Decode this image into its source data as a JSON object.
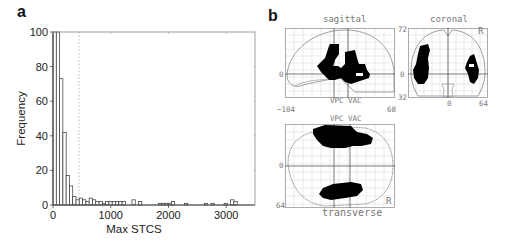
{
  "panels": {
    "a": {
      "label": "a"
    },
    "b": {
      "label": "b"
    }
  },
  "chart_data": [
    {
      "panel": "a",
      "type": "bar",
      "title": "",
      "xlabel": "Max STCS",
      "ylabel": "Frequency",
      "xlim": [
        0,
        3500
      ],
      "ylim": [
        0,
        100
      ],
      "xticks": [
        0,
        1000,
        2000,
        3000
      ],
      "yticks": [
        0,
        20,
        40,
        60,
        80,
        100
      ],
      "threshold_line_x": 450,
      "threshold_line_style": "dotted",
      "grid": false,
      "bin_width": 57,
      "bins_start": [
        0,
        57,
        114,
        171,
        228,
        285,
        342,
        399,
        456,
        513,
        570,
        627,
        684,
        741,
        798,
        855,
        912,
        969,
        1026,
        1083,
        1140,
        1197,
        1368,
        1482,
        1824,
        1881,
        1938,
        1995,
        2052,
        2280,
        2622,
        2736,
        2964,
        3078,
        3135
      ],
      "values": [
        100,
        100,
        73,
        42,
        17,
        11,
        5,
        3,
        4,
        3,
        2,
        4,
        3,
        2,
        2,
        1,
        2,
        2,
        2,
        2,
        2,
        2,
        3,
        2,
        1,
        1,
        1,
        1,
        2,
        1,
        1,
        1,
        1,
        3,
        2
      ]
    },
    {
      "panel": "b",
      "type": "other",
      "description": "SPM glass-brain maximum intensity projections",
      "views": [
        "sagittal",
        "coronal",
        "transverse"
      ]
    }
  ],
  "glass_brain": {
    "sagittal": {
      "title": "sagittal",
      "x_min_label": "−104",
      "x_max_label": "68",
      "y_zero_label": "0",
      "bottom_label": "VPC VAC"
    },
    "coronal": {
      "title": "coronal",
      "top_label": "72",
      "zero_label": "0",
      "bottom_label": "32",
      "x_zero_label": "0",
      "x_max_label": "64",
      "side_label": "R"
    },
    "transverse": {
      "title": "transverse",
      "top_label": "VPC VAC",
      "zero_label": "0",
      "bottom_label": "64",
      "side_label": "R"
    }
  },
  "colors": {
    "axis": "#444444",
    "bar_edge": "#333333",
    "bar_fill": "#ffffff",
    "threshold": "#aaaaaa",
    "blob": "#000000",
    "grid": "#cccccc",
    "outline": "#888888"
  }
}
